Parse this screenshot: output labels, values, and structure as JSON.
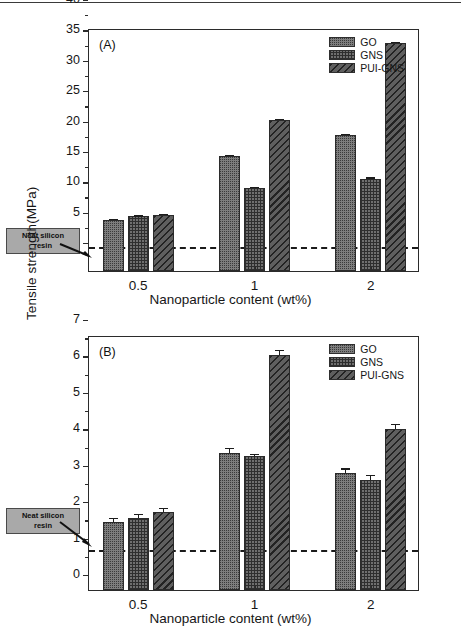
{
  "figure": {
    "panels": [
      "A",
      "B"
    ],
    "shared_xlabel_a": "Nanoparticle content (wt%)",
    "shared_xlabel_b": "Nanoparticle  content (wt%)"
  },
  "legend": {
    "items": [
      {
        "label": "GO",
        "pattern": "dotted-stipple",
        "color": "#7d7d7d"
      },
      {
        "label": "GNS",
        "pattern": "cross-hatch",
        "color": "#6f6f6f"
      },
      {
        "label": "PUI-GNS",
        "pattern": "diagonal-hatch",
        "color": "#5f5f5f"
      }
    ]
  },
  "annotation": {
    "line1": "Neat silicon",
    "line2": "resin"
  },
  "chart_data": [
    {
      "type": "bar",
      "panel": "(A)",
      "title": "",
      "xlabel": "Nanoparticle content (wt%)",
      "ylabel": "Elastic modulus(MPa)",
      "categories": [
        "0.5",
        "1",
        "2"
      ],
      "ylim": [
        0,
        40
      ],
      "yticks": [
        0,
        5,
        10,
        15,
        20,
        25,
        30,
        35,
        40
      ],
      "ytick_labels": [
        "0",
        "5",
        "10",
        "15",
        "20",
        "25",
        "30",
        "35",
        "40"
      ],
      "minor_ticks": true,
      "grid": false,
      "legend_position": "top-right",
      "reference_line": {
        "value": 3.6,
        "style": "dashed",
        "label": "Neat silicon resin"
      },
      "series": [
        {
          "name": "GO",
          "values": [
            8.4,
            18.9,
            22.4
          ],
          "errors": [
            0.15,
            0.2,
            0.2
          ]
        },
        {
          "name": "GNS",
          "values": [
            9.0,
            13.7,
            15.2
          ],
          "errors": [
            0.15,
            0.15,
            0.2
          ]
        },
        {
          "name": "PUI-GNS",
          "values": [
            9.2,
            24.9,
            37.5
          ],
          "errors": [
            0.15,
            0.2,
            0.25
          ]
        }
      ]
    },
    {
      "type": "bar",
      "panel": "(B)",
      "title": "",
      "xlabel": "Nanoparticle  content (wt%)",
      "ylabel": "Tensile strength(MPa)",
      "categories": [
        "0.5",
        "1",
        "2"
      ],
      "ylim": [
        0,
        7
      ],
      "yticks": [
        0,
        1,
        2,
        3,
        4,
        5,
        6,
        7
      ],
      "ytick_labels": [
        "0",
        "1",
        "2",
        "3",
        "4",
        "5",
        "6",
        "7"
      ],
      "minor_ticks": true,
      "grid": false,
      "legend_position": "top-right",
      "reference_line": {
        "value": 1.05,
        "style": "dashed",
        "label": "Neat silicon resin"
      },
      "series": [
        {
          "name": "GO",
          "values": [
            1.88,
            3.77,
            3.22
          ],
          "errors": [
            0.11,
            0.14,
            0.12
          ]
        },
        {
          "name": "GNS",
          "values": [
            1.97,
            3.68,
            3.03
          ],
          "errors": [
            0.11,
            0.06,
            0.12
          ]
        },
        {
          "name": "PUI-GNS",
          "values": [
            2.13,
            6.45,
            4.42
          ],
          "errors": [
            0.13,
            0.15,
            0.13
          ]
        }
      ]
    }
  ]
}
